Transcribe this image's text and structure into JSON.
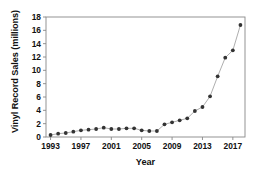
{
  "chart_data": {
    "type": "line",
    "title": "",
    "xlabel": "Year",
    "ylabel": "Vinyl Record Sales (millions)",
    "xlim": [
      1992.4,
      1992.4
    ],
    "x": [
      1993,
      1994,
      1995,
      1996,
      1997,
      1998,
      1999,
      2000,
      2001,
      2002,
      2003,
      2004,
      2005,
      2006,
      2007,
      2008,
      2009,
      2010,
      2011,
      2012,
      2013,
      2014,
      2015,
      2016,
      2017,
      2018
    ],
    "values": [
      0.3,
      0.5,
      0.6,
      0.8,
      1.0,
      1.1,
      1.2,
      1.4,
      1.2,
      1.2,
      1.3,
      1.3,
      1.0,
      0.9,
      0.9,
      1.9,
      2.2,
      2.5,
      2.8,
      3.9,
      4.5,
      6.1,
      9.1,
      11.9,
      13.0,
      14.3
    ],
    "grid": false,
    "legend": false,
    "marker": "filled-circle",
    "series_color": "#333333",
    "line_color": "#999999",
    "ylim": [
      0,
      18
    ],
    "yticks": [
      0,
      2,
      4,
      6,
      8,
      10,
      12,
      14,
      16,
      18
    ],
    "ytick_labels": [
      "0",
      "2",
      "4",
      "6",
      "8",
      "10",
      "12",
      "14",
      "16",
      "18"
    ],
    "xticks": [
      1993,
      1997,
      2001,
      2005,
      2009,
      2013,
      2017
    ],
    "xtick_labels": [
      "1993",
      "1997",
      "2001",
      "2005",
      "2009",
      "2013",
      "2017"
    ],
    "final_value": 16.8,
    "frame_color": "#888888"
  }
}
